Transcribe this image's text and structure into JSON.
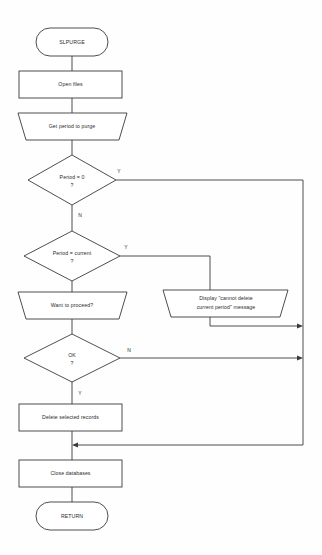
{
  "diagram": {
    "type": "flowchart",
    "title": "SLPURGE",
    "orientation": "top-to-bottom",
    "colors": {
      "background": "#fefefe",
      "stroke": "#3a3a3a",
      "shape_fill": "#ffffff",
      "text": "#2b2b2b"
    },
    "nodes": [
      {
        "id": "start",
        "shape": "terminator",
        "label": "SLPURGE",
        "x": 72,
        "y": 42,
        "w": 72,
        "h": 28
      },
      {
        "id": "open_files",
        "shape": "process",
        "label": "Open files",
        "x": 70,
        "y": 84,
        "w": 103,
        "h": 27
      },
      {
        "id": "get_period",
        "shape": "io",
        "label": "Get period to purge",
        "x": 72,
        "y": 126,
        "w": 109,
        "h": 27
      },
      {
        "id": "period_zero",
        "shape": "decision",
        "label_line1": "Period = 0",
        "label_line2": "?",
        "x": 72,
        "y": 180,
        "w": 88,
        "h": 50
      },
      {
        "id": "period_current",
        "shape": "decision",
        "label_line1": "Period = current",
        "label_line2": "?",
        "x": 72,
        "y": 256,
        "w": 96,
        "h": 50
      },
      {
        "id": "want_proceed",
        "shape": "io",
        "label": "Want to proceed?",
        "x": 72,
        "y": 305,
        "w": 109,
        "h": 27
      },
      {
        "id": "ok",
        "shape": "decision",
        "label_line1": "OK",
        "label_line2": "?",
        "x": 72,
        "y": 358,
        "w": 96,
        "h": 48
      },
      {
        "id": "display_msg",
        "shape": "io",
        "label_line1": "Display \"cannot delete",
        "label_line2": "current period\" message",
        "x": 226,
        "y": 303,
        "w": 125,
        "h": 27
      },
      {
        "id": "delete_records",
        "shape": "process",
        "label": "Delete selected records",
        "x": 70,
        "y": 417,
        "w": 103,
        "h": 27
      },
      {
        "id": "close_db",
        "shape": "process",
        "label": "Close databases",
        "x": 70,
        "y": 473,
        "w": 103,
        "h": 27
      },
      {
        "id": "return",
        "shape": "terminator",
        "label": "RETURN",
        "x": 72,
        "y": 516,
        "w": 72,
        "h": 28
      }
    ],
    "branch_labels": [
      {
        "id": "period-zero-yes",
        "text": "Y",
        "x": 119,
        "y": 172
      },
      {
        "id": "period-zero-no",
        "text": "N",
        "x": 80,
        "y": 216
      },
      {
        "id": "period-current-yes",
        "text": "Y",
        "x": 126,
        "y": 248
      },
      {
        "id": "ok-no",
        "text": "N",
        "x": 129,
        "y": 351
      },
      {
        "id": "ok-yes",
        "text": "Y",
        "x": 80,
        "y": 394
      }
    ],
    "edges": [
      {
        "from": "start",
        "to": "open_files",
        "label": ""
      },
      {
        "from": "open_files",
        "to": "get_period",
        "label": ""
      },
      {
        "from": "get_period",
        "to": "period_zero",
        "label": ""
      },
      {
        "from": "period_zero",
        "to": "exit_bus",
        "label": "Y"
      },
      {
        "from": "period_zero",
        "to": "period_current",
        "label": "N"
      },
      {
        "from": "period_current",
        "to": "display_msg",
        "label": "Y"
      },
      {
        "from": "period_current",
        "to": "want_proceed",
        "label": ""
      },
      {
        "from": "want_proceed",
        "to": "ok",
        "label": ""
      },
      {
        "from": "ok",
        "to": "exit_bus",
        "label": "N"
      },
      {
        "from": "ok",
        "to": "delete_records",
        "label": "Y"
      },
      {
        "from": "display_msg",
        "to": "exit_bus",
        "label": ""
      },
      {
        "from": "delete_records",
        "to": "close_db",
        "label": ""
      },
      {
        "from": "exit_bus",
        "to": "close_db",
        "label": ""
      },
      {
        "from": "close_db",
        "to": "return",
        "label": ""
      }
    ]
  }
}
